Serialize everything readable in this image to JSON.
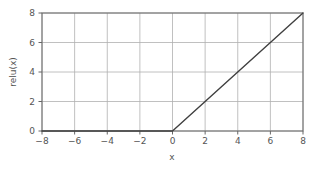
{
  "chart_data": {
    "type": "line",
    "title": "",
    "xlabel": "x",
    "ylabel": "relu(x)",
    "xlim": [
      -8,
      8
    ],
    "ylim": [
      0,
      8
    ],
    "grid": true,
    "legend": null,
    "xticks": [
      -8,
      -6,
      -4,
      -2,
      0,
      2,
      4,
      6,
      8
    ],
    "xtick_labels": [
      "−8",
      "−6",
      "−4",
      "−2",
      "0",
      "2",
      "4",
      "6",
      "8"
    ],
    "yticks": [
      0,
      2,
      4,
      6,
      8
    ],
    "ytick_labels": [
      "0",
      "2",
      "4",
      "6",
      "8"
    ],
    "series": [
      {
        "name": "relu(x)",
        "color": "#404040",
        "linewidth": 1.4,
        "x": [
          -8,
          -7,
          -6,
          -5,
          -4,
          -3,
          -2,
          -1,
          0,
          1,
          2,
          3,
          4,
          5,
          6,
          7,
          8
        ],
        "values": [
          0,
          0,
          0,
          0,
          0,
          0,
          0,
          0,
          0,
          1,
          2,
          3,
          4,
          5,
          6,
          7,
          8
        ]
      }
    ]
  },
  "style": {
    "background": "#ffffff",
    "grid_color": "#b0b0b0",
    "spine_color": "#666666",
    "tick_color": "#555555",
    "text_color": "#555555"
  },
  "geometry": {
    "plot_left": 42,
    "plot_right": 303,
    "plot_top": 13,
    "plot_bottom": 131
  }
}
